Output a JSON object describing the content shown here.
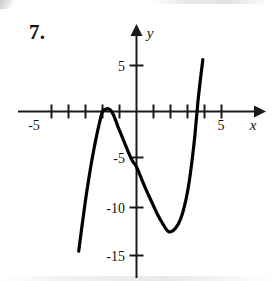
{
  "figure": {
    "problem_number": "7.",
    "background_color": "#ffffff",
    "curve_color": "#000000",
    "axis_color": "#1a1a1a"
  },
  "axes": {
    "x_axis_label": "x",
    "y_axis_label": "y",
    "x_tick_labels": [
      "-5",
      "5"
    ],
    "y_tick_labels": [
      "5",
      "-5",
      "-10",
      "-15"
    ]
  },
  "chart_data": {
    "type": "line",
    "title": "",
    "xlabel": "x",
    "ylabel": "y",
    "xlim": [
      -6.1,
      7.4
    ],
    "ylim": [
      -16.8,
      6.0
    ],
    "grid": false,
    "legend": null,
    "x_ticks": [
      -5,
      -4,
      -3,
      -2,
      -1,
      1,
      2,
      3,
      4,
      5
    ],
    "x_tick_labels_shown": {
      "-5": "-5",
      "5": "5"
    },
    "y_ticks": [
      5,
      -5,
      -10,
      -15
    ],
    "y_tick_labels_shown": {
      "5": "5",
      "-5": "-5",
      "-10": "-10",
      "-15": "-15"
    },
    "axis_arrows": [
      "x-positive",
      "y-positive"
    ],
    "series": [
      {
        "name": "cubic",
        "description": "cubic polynomial with local maximum just above the x-axis and a deep local minimum",
        "local_maximum": {
          "x": -1.65,
          "y": 0.3
        },
        "local_minimum": {
          "x": 1.9,
          "y": -13.0
        },
        "y_intercept": -6.0,
        "x_intercepts": [
          -2.0,
          -1.3,
          3.45
        ],
        "x_domain_drawn": [
          -3.4,
          3.9
        ],
        "x": [
          -3.4,
          -3.2,
          -3.0,
          -2.8,
          -2.6,
          -2.4,
          -2.2,
          -2.0,
          -1.8,
          -1.65,
          -1.5,
          -1.3,
          -1.1,
          -0.9,
          -0.7,
          -0.5,
          -0.25,
          0.0,
          0.3,
          0.6,
          0.9,
          1.2,
          1.5,
          1.9,
          2.3,
          2.6,
          2.9,
          3.1,
          3.3,
          3.45,
          3.6,
          3.75,
          3.9
        ],
        "y": [
          -15.1,
          -12.3,
          -9.6,
          -7.2,
          -5.0,
          -3.1,
          -1.4,
          0.0,
          0.25,
          0.3,
          0.1,
          -0.6,
          -1.6,
          -2.5,
          -3.4,
          -4.3,
          -5.3,
          -6.0,
          -7.3,
          -8.6,
          -9.8,
          -11.0,
          -12.0,
          -13.0,
          -12.6,
          -11.6,
          -9.6,
          -7.6,
          -4.8,
          -2.3,
          0.8,
          3.3,
          5.6
        ]
      }
    ]
  }
}
